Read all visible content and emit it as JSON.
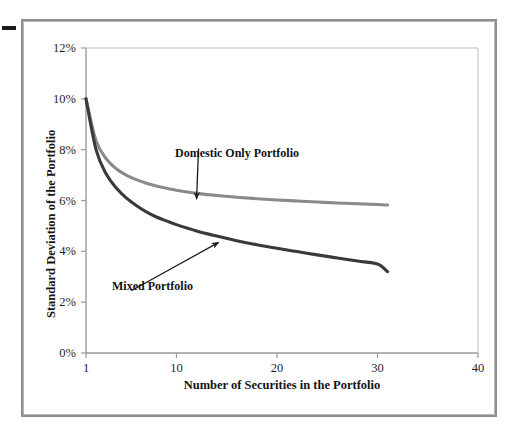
{
  "figure": {
    "edge_mark_name": "page-edge-tick-mark",
    "background_color": "#ffffff",
    "frame_color": "#8e8e8e"
  },
  "chart_data": {
    "type": "line",
    "title": "",
    "xlabel": "Number of Securities in the Portfolio",
    "ylabel": "Standard Deviation of the Portfolio",
    "xlim": [
      1,
      40
    ],
    "ylim": [
      0,
      12
    ],
    "xticks": [
      1,
      10,
      20,
      30,
      40
    ],
    "xtick_labels": [
      "1",
      "10",
      "20",
      "30",
      "40"
    ],
    "yticks": [
      0,
      2,
      4,
      6,
      8,
      10,
      12
    ],
    "ytick_labels": [
      "0%",
      "2%",
      "4%",
      "6%",
      "8%",
      "10%",
      "12%"
    ],
    "grid": false,
    "legend_position": "inline-annotations",
    "y_unit": "%",
    "series": [
      {
        "name": "Domestic Only Portfolio",
        "color": "#8a8a8a",
        "x": [
          1,
          2,
          3,
          4,
          5,
          6,
          7,
          8,
          9,
          10,
          12,
          14,
          16,
          18,
          20,
          22,
          24,
          26,
          28,
          30,
          31
        ],
        "values": [
          10.0,
          8.35,
          7.65,
          7.25,
          7.0,
          6.82,
          6.68,
          6.57,
          6.48,
          6.4,
          6.28,
          6.2,
          6.13,
          6.07,
          6.02,
          5.98,
          5.94,
          5.9,
          5.87,
          5.84,
          5.82
        ]
      },
      {
        "name": "Mixed Portfolio",
        "color": "#3a3a3a",
        "x": [
          1,
          2,
          3,
          4,
          5,
          6,
          7,
          8,
          9,
          10,
          12,
          14,
          16,
          18,
          20,
          22,
          24,
          26,
          28,
          30,
          31
        ],
        "values": [
          10.0,
          8.0,
          7.05,
          6.5,
          6.1,
          5.8,
          5.55,
          5.35,
          5.2,
          5.05,
          4.8,
          4.6,
          4.42,
          4.26,
          4.12,
          3.99,
          3.86,
          3.74,
          3.62,
          3.5,
          3.2
        ]
      }
    ],
    "annotations": [
      {
        "name": "domestic-only-portfolio",
        "text": "Domestic Only Portfolio",
        "label_x": 12.2,
        "label_y": 8.05,
        "arrow_tip_x": 12.0,
        "arrow_tip_y": 6.05
      },
      {
        "name": "mixed-portfolio",
        "text": "Mixed Portfolio",
        "label_x": 5.5,
        "label_y": 2.45,
        "arrow_tip_x": 14.2,
        "arrow_tip_y": 4.35
      }
    ]
  }
}
